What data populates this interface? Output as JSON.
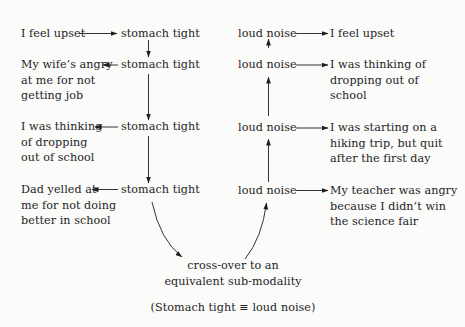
{
  "diagram": {
    "left_column": {
      "rows": [
        {
          "cause_lines": [
            "I feel upset"
          ],
          "feeling": "stomach tight"
        },
        {
          "cause_lines": [
            "My wife’s angry",
            "at me for not",
            "getting job"
          ],
          "feeling": "stomach tight"
        },
        {
          "cause_lines": [
            "I was thinking",
            "of dropping",
            "out of school"
          ],
          "feeling": "stomach tight"
        },
        {
          "cause_lines": [
            "Dad yelled at",
            "me for not doing",
            "better in school"
          ],
          "feeling": "stomach tight"
        }
      ]
    },
    "right_column": {
      "rows": [
        {
          "feeling": "loud noise",
          "effect_lines": [
            "I feel upset"
          ]
        },
        {
          "feeling": "loud noise",
          "effect_lines": [
            "I was thinking of",
            "dropping out of",
            "school"
          ]
        },
        {
          "feeling": "loud noise",
          "effect_lines": [
            "I was starting on a",
            "hiking trip, but quit",
            "after the first day"
          ]
        },
        {
          "feeling": "loud noise",
          "effect_lines": [
            "My teacher was angry",
            "because I didn’t win",
            "the science fair"
          ]
        }
      ]
    },
    "crossover": {
      "lines": [
        "cross-over to an",
        "equivalent sub-modality"
      ],
      "equivalence": "(Stomach tight ≡ loud noise)"
    },
    "arrow_color": "#1e1e1e"
  }
}
